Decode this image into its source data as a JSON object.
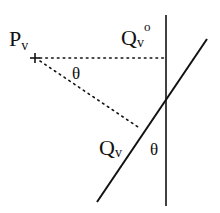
{
  "diagram": {
    "labels": {
      "point_p": "P",
      "point_p_sub": "v",
      "point_q0": "Q",
      "point_q0_sub": "v",
      "point_q0_sup": "o",
      "point_q": "Q",
      "point_q_sub": "v",
      "angle_upper": "θ",
      "angle_lower": "θ"
    },
    "colors": {
      "line": "#111111",
      "background": "#ffffff"
    }
  }
}
